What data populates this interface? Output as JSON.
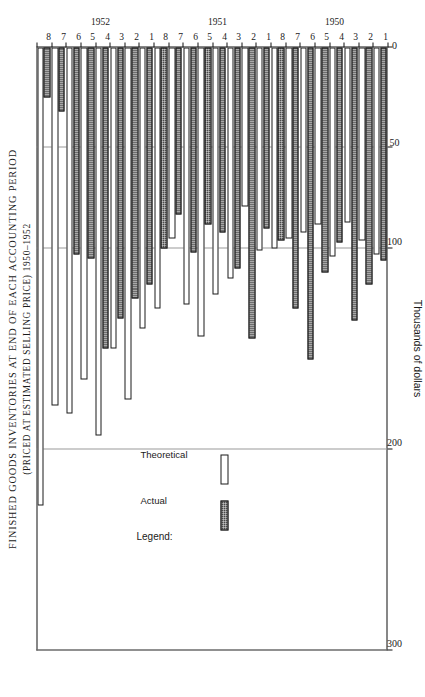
{
  "title": {
    "line1": "FINISHED GOODS INVENTORIES AT END OF EACH ACCOUNTING PERIOD",
    "line2": "(PRICED AT ESTIMATED SELLING PRICE) 1950–1952"
  },
  "legend": {
    "heading": "Legend:",
    "actual_label": "Actual",
    "theoretical_label": "Theoretical",
    "actual_color": "#4a4a4a",
    "theoretical_color": "#ffffff"
  },
  "chart_data": {
    "type": "bar",
    "orientation": "horizontal",
    "title": "FINISHED GOODS INVENTORIES AT END OF EACH ACCOUNTING PERIOD",
    "subtitle": "(PRICED AT ESTIMATED SELLING PRICE) 1950–1952",
    "xlabel": "Thousands of dollars",
    "ylabel": "",
    "xlim": [
      0,
      300
    ],
    "xticks": [
      0,
      50,
      100,
      200,
      300
    ],
    "xticklabels": [
      "0",
      "50",
      "100",
      "200",
      "300"
    ],
    "grid": true,
    "grid_axis": "x",
    "legend": [
      "Actual",
      "Theoretical"
    ],
    "legend_position": "inside-left",
    "categories": [
      "1950-1",
      "1950-2",
      "1950-3",
      "1950-4",
      "1950-5",
      "1950-6",
      "1950-7",
      "1950-8",
      "1951-1",
      "1951-2",
      "1951-3",
      "1951-4",
      "1951-5",
      "1951-6",
      "1951-7",
      "1951-8",
      "1952-1",
      "1952-2",
      "1952-3",
      "1952-4",
      "1952-5",
      "1952-6",
      "1952-7",
      "1952-8"
    ],
    "period_labels": [
      "1",
      "2",
      "3",
      "4",
      "5",
      "6",
      "7",
      "8",
      "1",
      "2",
      "3",
      "4",
      "5",
      "6",
      "7",
      "8",
      "1",
      "2",
      "3",
      "4",
      "5",
      "6",
      "7",
      "8"
    ],
    "year_groups": [
      {
        "year": "1950",
        "start_index": 0,
        "end_index": 7
      },
      {
        "year": "1951",
        "start_index": 8,
        "end_index": 15
      },
      {
        "year": "1952",
        "start_index": 16,
        "end_index": 23
      }
    ],
    "series": [
      {
        "name": "Actual",
        "values": [
          106,
          118,
          136,
          97,
          112,
          155,
          130,
          96,
          90,
          145,
          110,
          92,
          88,
          102,
          83,
          100,
          118,
          125,
          135,
          150,
          105,
          103,
          32,
          25
        ]
      },
      {
        "name": "Theoretical",
        "values": [
          103,
          96,
          87,
          104,
          88,
          92,
          95,
          100,
          101,
          79,
          115,
          123,
          144,
          128,
          95,
          130,
          140,
          175,
          150,
          193,
          165,
          182,
          178,
          228
        ]
      }
    ]
  },
  "value_axis": {
    "title": "Thousands of dollars",
    "ticks": [
      {
        "value": 0,
        "label": "0"
      },
      {
        "value": 50,
        "label": "50"
      },
      {
        "value": 100,
        "label": "100"
      },
      {
        "value": 200,
        "label": "200"
      },
      {
        "value": 300,
        "label": "300"
      }
    ]
  }
}
